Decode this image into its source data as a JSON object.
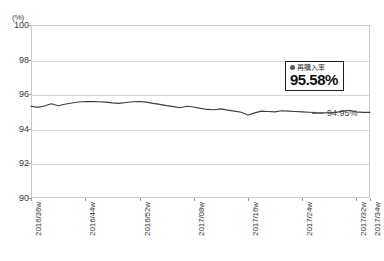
{
  "chart_data": {
    "type": "line",
    "title": "",
    "subtitle": "",
    "xlabel": "",
    "ylabel": "(%)",
    "unit_label": "(%)",
    "ylim": [
      90,
      100
    ],
    "yticks": [
      100,
      98,
      96,
      94,
      92,
      90
    ],
    "grid": true,
    "legend_position": "inline-tooltip",
    "categories": [
      "2016/36w",
      "2016/37w",
      "2016/38w",
      "2016/39w",
      "2016/40w",
      "2016/41w",
      "2016/42w",
      "2016/43w",
      "2016/44w",
      "2016/45w",
      "2016/46w",
      "2016/47w",
      "2016/48w",
      "2016/49w",
      "2016/50w",
      "2016/51w",
      "2016/52w",
      "2017/01w",
      "2017/02w",
      "2017/03w",
      "2017/04w",
      "2017/05w",
      "2017/06w",
      "2017/07w",
      "2017/08w",
      "2017/09w",
      "2017/10w",
      "2017/11w",
      "2017/12w",
      "2017/13w",
      "2017/14w",
      "2017/15w",
      "2017/16w",
      "2017/17w",
      "2017/18w",
      "2017/19w",
      "2017/20w",
      "2017/21w",
      "2017/22w",
      "2017/23w",
      "2017/24w",
      "2017/25w",
      "2017/26w",
      "2017/27w",
      "2017/28w",
      "2017/29w",
      "2017/30w",
      "2017/31w",
      "2017/32w",
      "2017/33w",
      "2017/34w"
    ],
    "xtick_labels": [
      "2016/36w",
      "2016/44w",
      "2016/52w",
      "2017/08w",
      "2017/16w",
      "2017/24w",
      "2017/32w",
      "2017/34w"
    ],
    "xtick_indices": [
      0,
      8,
      16,
      24,
      32,
      40,
      48,
      50
    ],
    "series": [
      {
        "name": "再購入率",
        "color": "#3d3d3d",
        "values": [
          95.3,
          95.24,
          95.32,
          95.45,
          95.33,
          95.42,
          95.49,
          95.55,
          95.58,
          95.57,
          95.56,
          95.54,
          95.5,
          95.47,
          95.52,
          95.56,
          95.58,
          95.54,
          95.47,
          95.41,
          95.34,
          95.28,
          95.22,
          95.3,
          95.26,
          95.18,
          95.12,
          95.1,
          95.15,
          95.08,
          95.02,
          94.96,
          94.8,
          94.92,
          95.02,
          95.0,
          94.98,
          95.04,
          95.02,
          95.0,
          94.98,
          94.96,
          94.94,
          94.93,
          94.92,
          94.95,
          95.02,
          95.06,
          94.98,
          94.95,
          94.95
        ]
      }
    ],
    "annotations": {
      "tooltip": {
        "series_label": "再購入率",
        "value": "95.58%",
        "marker_color": "#5a5a5a"
      },
      "end_label": "94.95%"
    }
  }
}
